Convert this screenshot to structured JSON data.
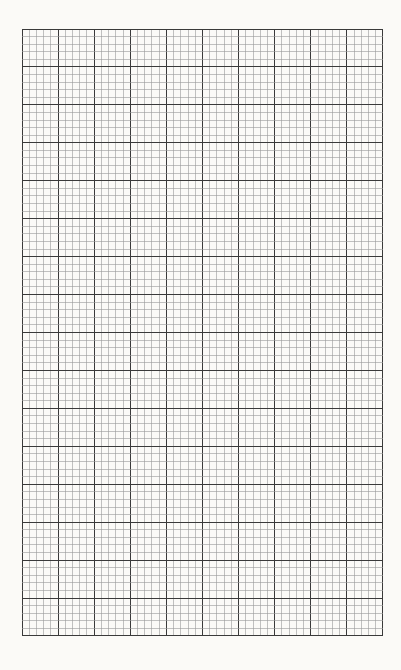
{
  "sheet": {
    "type": "graph-paper",
    "major_columns": 10,
    "major_rows": 16,
    "minor_divisions_per_major": 5,
    "colors": {
      "background": "#fbfaf7",
      "minor_line": "#9a9a9a",
      "major_line": "#3a3a3a"
    }
  }
}
